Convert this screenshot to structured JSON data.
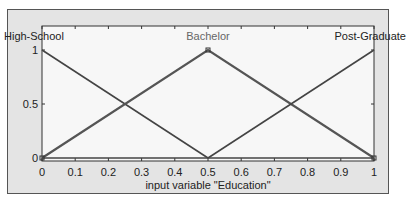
{
  "chart_data": {
    "type": "line",
    "title": "",
    "xlabel": "input variable \"Education\"",
    "ylabel": "",
    "xlim": [
      0,
      1
    ],
    "ylim": [
      0,
      1
    ],
    "xticks": [
      0,
      0.1,
      0.2,
      0.3,
      0.4,
      0.5,
      0.6,
      0.7,
      0.8,
      0.9,
      1
    ],
    "xtick_labels": [
      "0",
      "0.1",
      "0.2",
      "0.3",
      "0.4",
      "0.5",
      "0.6",
      "0.7",
      "0.8",
      "0.9",
      "1"
    ],
    "yticks": [
      0,
      0.5,
      1
    ],
    "ytick_labels": [
      "0",
      "0.5",
      "1"
    ],
    "grid": false,
    "series": [
      {
        "name": "High-School",
        "x": [
          0,
          0.5
        ],
        "y": [
          1,
          0
        ],
        "color": "#444444",
        "selected": false
      },
      {
        "name": "Bachelor",
        "x": [
          0,
          0.5,
          1
        ],
        "y": [
          0,
          1,
          0
        ],
        "color": "#555555",
        "selected": true
      },
      {
        "name": "Post-Graduate",
        "x": [
          0.5,
          1
        ],
        "y": [
          0,
          1
        ],
        "color": "#444444",
        "selected": false
      }
    ],
    "series_label_positions": [
      "top-left",
      "top-center",
      "top-right"
    ]
  }
}
